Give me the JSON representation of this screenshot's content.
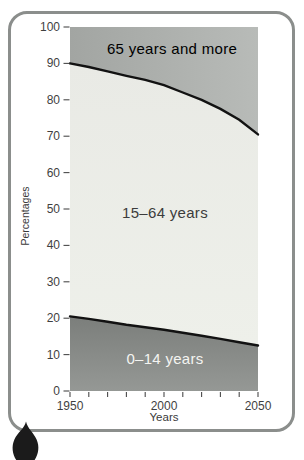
{
  "figure": {
    "background": "#ffffff",
    "frame_border_color": "#8b8e8c",
    "pointer_marker_color": "#1b1b1b"
  },
  "chart_data": {
    "type": "area",
    "stacked": true,
    "title": "",
    "xlabel": "Years",
    "ylabel": "Percentages",
    "xlim": [
      1950,
      2050
    ],
    "ylim": [
      0,
      100
    ],
    "x_tick_step": 10,
    "y_tick_step": 10,
    "y_tick_labels": [
      0,
      10,
      20,
      30,
      40,
      50,
      60,
      70,
      80,
      90,
      100
    ],
    "x_major_tick_labels": [
      1950,
      2000,
      2050
    ],
    "boundary_line_color": "#121212",
    "tick_color": "#4a4a4a",
    "grid": "off",
    "legend_position": "labels-inside-bands",
    "x": [
      1950,
      1960,
      1970,
      1980,
      1990,
      2000,
      2010,
      2020,
      2030,
      2040,
      2050
    ],
    "series": [
      {
        "name": "0–14 years",
        "values": [
          20.5,
          19.8,
          19.0,
          18.2,
          17.5,
          16.8,
          16.0,
          15.2,
          14.3,
          13.4,
          12.5
        ],
        "fill": [
          "#7b7e7b",
          "#959895"
        ],
        "label_color": "#f4f4f1"
      },
      {
        "name": "15–64 years",
        "values": [
          69.5,
          69.2,
          68.8,
          68.4,
          68.0,
          67.2,
          66.0,
          64.8,
          63.2,
          61.1,
          58.0
        ],
        "fill": [
          "#e9eae5",
          "#eef0ea"
        ],
        "label_color": "#3c3c3c"
      },
      {
        "name": "65 years and more",
        "values": [
          10.0,
          11.0,
          12.2,
          13.4,
          14.5,
          16.0,
          18.0,
          20.0,
          22.5,
          25.5,
          29.5
        ],
        "fill": [
          "#a2a5a2",
          "#b8bbb8"
        ],
        "label_color": "#eceder"
      }
    ]
  }
}
